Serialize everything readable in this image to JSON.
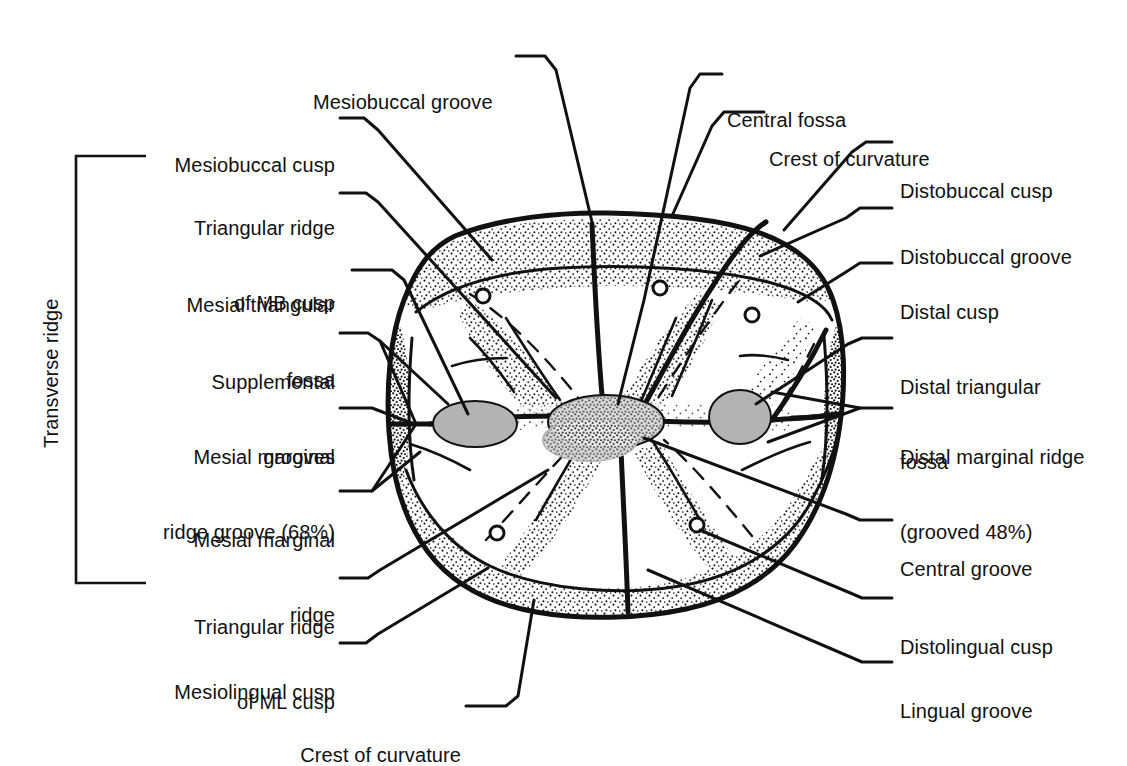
{
  "figure": {
    "ink_color": "#111111",
    "fossa_fill": "#b3b3b3",
    "stipple_color": "#1a1a1a",
    "background": "#ffffff"
  },
  "bracket": {
    "label": "Transverse ridge"
  },
  "labels_left": [
    {
      "id": "mesiobuccal-cusp",
      "lines": [
        "Mesiobuccal cusp"
      ]
    },
    {
      "id": "triangular-ridge-mb",
      "lines": [
        "Triangular ridge",
        "of MB cusp"
      ]
    },
    {
      "id": "mesial-triangular-fossa",
      "lines": [
        "Mesial triangular",
        "fossa"
      ]
    },
    {
      "id": "supplemental-grooves",
      "lines": [
        "Supplemental",
        "grooves"
      ]
    },
    {
      "id": "mesial-marginal-ridge-groove",
      "lines": [
        "Mesial marginal",
        "ridge groove (68%)"
      ]
    },
    {
      "id": "mesial-marginal-ridge",
      "lines": [
        "Mesial marginal",
        "ridge"
      ]
    },
    {
      "id": "triangular-ridge-ml",
      "lines": [
        "Triangular ridge",
        "of ML cusp"
      ]
    },
    {
      "id": "mesiolingual-cusp",
      "lines": [
        "Mesiolingual cusp"
      ]
    }
  ],
  "labels_top": [
    {
      "id": "mesiobuccal-groove",
      "lines": [
        "Mesiobuccal groove"
      ]
    },
    {
      "id": "central-fossa",
      "lines": [
        "Central fossa"
      ]
    },
    {
      "id": "crest-of-curvature-top",
      "lines": [
        "Crest of curvature"
      ]
    }
  ],
  "labels_right": [
    {
      "id": "distobuccal-cusp",
      "lines": [
        "Distobuccal cusp"
      ]
    },
    {
      "id": "distobuccal-groove",
      "lines": [
        "Distobuccal groove"
      ]
    },
    {
      "id": "distal-cusp",
      "lines": [
        "Distal cusp"
      ]
    },
    {
      "id": "distal-triangular-fossa",
      "lines": [
        "Distal triangular",
        "fossa"
      ]
    },
    {
      "id": "distal-marginal-ridge",
      "lines": [
        "Distal marginal ridge",
        "(grooved 48%)"
      ]
    },
    {
      "id": "central-groove",
      "lines": [
        "Central groove"
      ]
    },
    {
      "id": "distolingual-cusp",
      "lines": [
        "Distolingual cusp"
      ]
    },
    {
      "id": "lingual-groove",
      "lines": [
        "Lingual groove"
      ]
    }
  ],
  "labels_bottom": [
    {
      "id": "crest-of-curvature-bottom",
      "lines": [
        "Crest of curvature"
      ]
    }
  ]
}
